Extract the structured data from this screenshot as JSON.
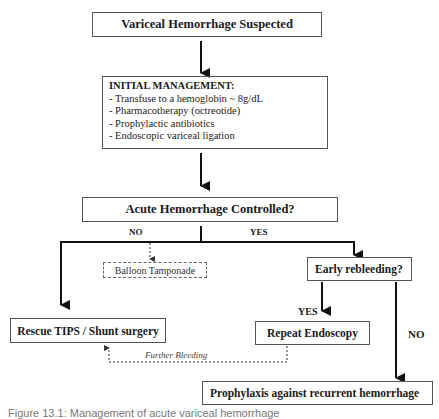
{
  "nodes": {
    "start": "Variceal Hemorrhage Suspected",
    "initial_management": {
      "heading": "INITIAL MANAGEMENT:",
      "items": [
        "- Transfuse to a hemoglobin ~ 8g/dL",
        "-  Pharmacotherapy (octreotide)",
        "-  Prophylactic antibiotics",
        "-  Endoscopic variceal ligation"
      ]
    },
    "decision_controlled": "Acute Hemorrhage Controlled?",
    "balloon": "Balloon Tamponade",
    "rescue": "Rescue TIPS / Shunt surgery",
    "early_rebleeding": "Early rebleeding?",
    "repeat_endoscopy": "Repeat Endoscopy",
    "prophylaxis": "Prophylaxis against recurrent hemorrhage"
  },
  "edges": {
    "no_label": "NO",
    "yes_label": "YES",
    "rebleed_yes_label": "YES",
    "rebleed_no_label": "NO",
    "further_bleeding": "Further Bleeding"
  },
  "caption": "Figure 13.1: Management of acute variceal hemorrhage"
}
